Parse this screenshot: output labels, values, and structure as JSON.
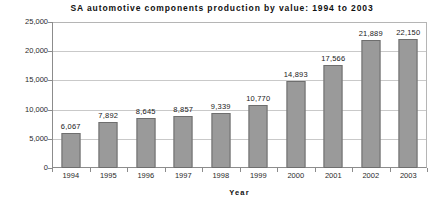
{
  "chart_data": {
    "type": "bar",
    "title": "SA automotive components production by value: 1994 to 2003",
    "xlabel": "Year",
    "ylabel": "Rand (Million)",
    "categories": [
      "1994",
      "1995",
      "1996",
      "1997",
      "1998",
      "1999",
      "2000",
      "2001",
      "2002",
      "2003"
    ],
    "values": [
      6067,
      7892,
      8645,
      8857,
      9339,
      10770,
      14893,
      17566,
      21889,
      22150
    ],
    "value_labels": [
      "6,067",
      "7,892",
      "8,645",
      "8,857",
      "9,339",
      "10,770",
      "14,893",
      "17,566",
      "21,889",
      "22,150"
    ],
    "ylim": [
      0,
      25000
    ],
    "yticks": [
      0,
      5000,
      10000,
      15000,
      20000,
      25000
    ],
    "ytick_labels": [
      "0",
      "5,000",
      "10,000",
      "15,000",
      "20,000",
      "25,000"
    ],
    "grid": true,
    "legend": false,
    "bar_color": "#9a9a9a",
    "bar_edge_color": "#6e6e6e",
    "gridline_color": "#c9c9c9",
    "axis_color": "#8c8c8c"
  }
}
